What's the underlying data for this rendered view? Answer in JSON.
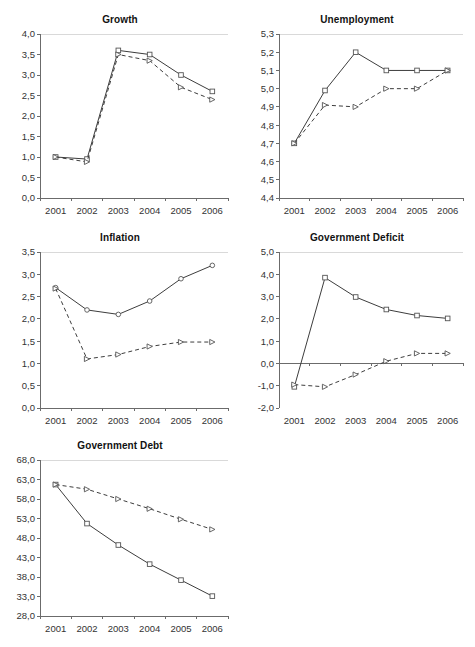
{
  "figure": {
    "background_color": "#ffffff",
    "axis_color": "#6b6b6b",
    "series_color": "#3d3d3d",
    "panel_count": 5
  },
  "chart_data": [
    {
      "id": "growth",
      "type": "line",
      "title": "Growth",
      "xlabel": "",
      "ylabel": "",
      "categories": [
        "2001",
        "2002",
        "2003",
        "2004",
        "2005",
        "2006"
      ],
      "x": [
        2001,
        2002,
        2003,
        2004,
        2005,
        2006
      ],
      "ylim": [
        0.0,
        4.0
      ],
      "ytick_step": 0.5,
      "ytick_labels": [
        "0,0",
        "0,5",
        "1,0",
        "1,5",
        "2,0",
        "2,5",
        "3,0",
        "3,5",
        "4,0"
      ],
      "ytick_values": [
        0.0,
        0.5,
        1.0,
        1.5,
        2.0,
        2.5,
        3.0,
        3.5,
        4.0
      ],
      "grid": false,
      "legend_position": "none",
      "series": [
        {
          "name": "solid",
          "style": "solid",
          "marker": "square",
          "values": [
            1.0,
            0.95,
            3.6,
            3.5,
            3.0,
            2.6
          ]
        },
        {
          "name": "dashed",
          "style": "dashed",
          "marker": "triangle",
          "values": [
            1.0,
            0.88,
            3.5,
            3.35,
            2.7,
            2.4
          ]
        }
      ]
    },
    {
      "id": "unemployment",
      "type": "line",
      "title": "Unemployment",
      "xlabel": "",
      "ylabel": "",
      "categories": [
        "2001",
        "2002",
        "2003",
        "2004",
        "2005",
        "2006"
      ],
      "x": [
        2001,
        2002,
        2003,
        2004,
        2005,
        2006
      ],
      "ylim": [
        4.4,
        5.3
      ],
      "ytick_step": 0.1,
      "ytick_labels": [
        "4,4",
        "4,5",
        "4,6",
        "4,7",
        "4,8",
        "4,9",
        "5,0",
        "5,1",
        "5,2",
        "5,3"
      ],
      "ytick_values": [
        4.4,
        4.5,
        4.6,
        4.7,
        4.8,
        4.9,
        5.0,
        5.1,
        5.2,
        5.3
      ],
      "grid": false,
      "legend_position": "none",
      "series": [
        {
          "name": "solid",
          "style": "solid",
          "marker": "square",
          "values": [
            4.7,
            4.99,
            5.2,
            5.1,
            5.1,
            5.1
          ]
        },
        {
          "name": "dashed",
          "style": "dashed",
          "marker": "triangle",
          "values": [
            4.7,
            4.91,
            4.9,
            5.0,
            5.0,
            5.1
          ]
        }
      ]
    },
    {
      "id": "inflation",
      "type": "line",
      "title": "Inflation",
      "xlabel": "",
      "ylabel": "",
      "categories": [
        "2001",
        "2002",
        "2003",
        "2004",
        "2005",
        "2006"
      ],
      "x": [
        2001,
        2002,
        2003,
        2004,
        2005,
        2006
      ],
      "ylim": [
        0.0,
        3.5
      ],
      "ytick_step": 0.5,
      "ytick_labels": [
        "0,0",
        "0,5",
        "1,0",
        "1,5",
        "2,0",
        "2,5",
        "3,0",
        "3,5"
      ],
      "ytick_values": [
        0.0,
        0.5,
        1.0,
        1.5,
        2.0,
        2.5,
        3.0,
        3.5
      ],
      "grid": false,
      "legend_position": "none",
      "series": [
        {
          "name": "solid",
          "style": "solid",
          "marker": "circle",
          "values": [
            2.7,
            2.2,
            2.1,
            2.4,
            2.9,
            3.2
          ]
        },
        {
          "name": "dashed",
          "style": "dashed",
          "marker": "triangle",
          "values": [
            2.68,
            1.1,
            1.2,
            1.38,
            1.48,
            1.48
          ]
        }
      ]
    },
    {
      "id": "government-deficit",
      "type": "line",
      "title": "Government Deficit",
      "xlabel": "",
      "ylabel": "",
      "categories": [
        "2001",
        "2002",
        "2003",
        "2004",
        "2005",
        "2006"
      ],
      "x": [
        2001,
        2002,
        2003,
        2004,
        2005,
        2006
      ],
      "ylim": [
        -2.0,
        5.0
      ],
      "ytick_step": 1.0,
      "ytick_labels": [
        "-2,0",
        "-1,0",
        "0,0",
        "1,0",
        "2,0",
        "3,0",
        "4,0",
        "5,0"
      ],
      "ytick_values": [
        -2.0,
        -1.0,
        0.0,
        1.0,
        2.0,
        3.0,
        4.0,
        5.0
      ],
      "grid": false,
      "zero_line": true,
      "legend_position": "none",
      "series": [
        {
          "name": "solid",
          "style": "solid",
          "marker": "square",
          "values": [
            -1.05,
            3.85,
            2.98,
            2.42,
            2.15,
            2.02
          ]
        },
        {
          "name": "dashed",
          "style": "dashed",
          "marker": "triangle",
          "values": [
            -0.95,
            -1.05,
            -0.5,
            0.1,
            0.45,
            0.45
          ]
        }
      ]
    },
    {
      "id": "government-debt",
      "type": "line",
      "title": "Government Debt",
      "xlabel": "",
      "ylabel": "",
      "categories": [
        "2001",
        "2002",
        "2003",
        "2004",
        "2005",
        "2006"
      ],
      "x": [
        2001,
        2002,
        2003,
        2004,
        2005,
        2006
      ],
      "ylim": [
        28.0,
        68.0
      ],
      "ytick_step": 5.0,
      "ytick_labels": [
        "28,0",
        "33,0",
        "38,0",
        "43,0",
        "48,0",
        "53,0",
        "58,0",
        "63,0",
        "68,0"
      ],
      "ytick_values": [
        28.0,
        33.0,
        38.0,
        43.0,
        48.0,
        53.0,
        58.0,
        63.0,
        68.0
      ],
      "grid": false,
      "legend_position": "none",
      "series": [
        {
          "name": "solid",
          "style": "solid",
          "marker": "square",
          "values": [
            61.7,
            51.7,
            46.2,
            41.3,
            37.2,
            33.1
          ]
        },
        {
          "name": "dashed",
          "style": "dashed",
          "marker": "triangle",
          "values": [
            61.7,
            60.5,
            58.0,
            55.5,
            52.8,
            50.2
          ]
        }
      ]
    }
  ],
  "layout": {
    "panels": [
      {
        "id": "growth",
        "left": 4,
        "top": 14,
        "width": 232,
        "height": 212
      },
      {
        "id": "unemployment",
        "left": 243,
        "top": 14,
        "width": 228,
        "height": 212
      },
      {
        "id": "inflation",
        "left": 4,
        "top": 232,
        "width": 232,
        "height": 204
      },
      {
        "id": "government-deficit",
        "left": 243,
        "top": 232,
        "width": 228,
        "height": 204
      },
      {
        "id": "government-debt",
        "left": 4,
        "top": 440,
        "width": 232,
        "height": 204
      }
    ]
  }
}
